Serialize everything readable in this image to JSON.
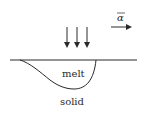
{
  "diagram": {
    "labels": {
      "melt": "melt",
      "solid": "solid",
      "vector": "α"
    },
    "colors": {
      "stroke": "#2a2a2a",
      "background": "#ffffff"
    },
    "elements": {
      "incoming_arrows_count": 3,
      "surface_line": "horizontal surface line",
      "melt_pool": "melt pool boundary curve",
      "velocity_vector": "vector arrow pointing right"
    }
  }
}
